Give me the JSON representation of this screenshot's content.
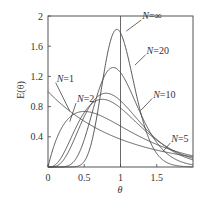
{
  "chart_data": {
    "type": "line",
    "title": "",
    "xlabel": "θ",
    "ylabel": "E(θ)",
    "xlim": [
      0,
      2
    ],
    "ylim": [
      0,
      2
    ],
    "xticks": [
      {
        "value": 0,
        "label": "0"
      },
      {
        "value": 0.5,
        "label": "0.5"
      },
      {
        "value": 1,
        "label": "1"
      },
      {
        "value": 1.5,
        "label": "1.5"
      }
    ],
    "yticks": [
      {
        "value": 0.4,
        "label": "0.4"
      },
      {
        "value": 0.8,
        "label": "0.8"
      },
      {
        "value": 1.2,
        "label": "1.2"
      },
      {
        "value": 1.6,
        "label": "1.6"
      },
      {
        "value": 2,
        "label": "2"
      }
    ],
    "reference_line_x": 1,
    "model": "tanks-in-series E(θ) = N^N θ^(N-1) e^(-Nθ) / (N-1)!",
    "model_N_note": "N values below are inferred from drawn peak heights, not read from the screenshot; they do not all equal the printed labels",
    "series": [
      {
        "name": "N=1",
        "label": "N=1",
        "N": 1,
        "label_at": [
          0.12,
          1.13
        ],
        "point_at": [
          0.3,
          0.74
        ]
      },
      {
        "name": "N=2",
        "label": "N=2",
        "N": 2,
        "label_at": [
          0.4,
          0.86
        ],
        "point_at": [
          0.3,
          0.6
        ]
      },
      {
        "name": "N=5",
        "label": "N=5",
        "N": 4,
        "label_at": [
          1.7,
          0.33
        ],
        "point_at": [
          1.58,
          0.2
        ]
      },
      {
        "name": "N=10",
        "label": "N=10",
        "N": 5,
        "label_at": [
          1.45,
          0.92
        ],
        "point_at": [
          1.28,
          0.75
        ]
      },
      {
        "name": "N=20",
        "label": "N=20",
        "N": 10,
        "label_at": [
          1.36,
          1.5
        ],
        "point_at": [
          1.2,
          1.35
        ]
      },
      {
        "name": "N=∞",
        "label": "N=∞",
        "N": 20,
        "label_at": [
          1.3,
          1.96
        ],
        "point_at": [
          1.08,
          1.8
        ]
      }
    ],
    "grid": false,
    "legend": "inline-labels"
  }
}
